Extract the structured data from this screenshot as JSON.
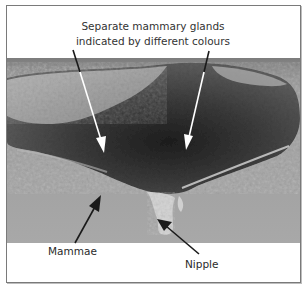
{
  "figure": {
    "caption_lines": [
      "Separate mammary glands",
      "indicated by different colours"
    ],
    "labels": {
      "mammae": "Mammae",
      "nipple": "Nipple"
    },
    "photo": {
      "description": "Grayscale photograph of dissected bovine udder tissue with separate mammary glands and a nipple",
      "tone": "grayscale"
    },
    "arrows": [
      {
        "name": "gland-arrow-left",
        "from": [
          73,
          50
        ],
        "to": [
          104,
          153
        ],
        "color_outside": "#1a1a1a",
        "color_inside": "#ffffff"
      },
      {
        "name": "gland-arrow-right",
        "from": [
          209,
          51
        ],
        "to": [
          186,
          150
        ],
        "color_outside": "#1a1a1a",
        "color_inside": "#ffffff"
      },
      {
        "name": "mammae-arrow",
        "from": [
          75,
          243
        ],
        "to": [
          101,
          195
        ],
        "color": "#1a1a1a"
      },
      {
        "name": "nipple-arrow",
        "from": [
          199,
          254
        ],
        "to": [
          157,
          219
        ],
        "color": "#1a1a1a"
      }
    ],
    "colors": {
      "border": "#7a7a7a",
      "background": "#ffffff",
      "text": "#2a2a2a"
    }
  }
}
